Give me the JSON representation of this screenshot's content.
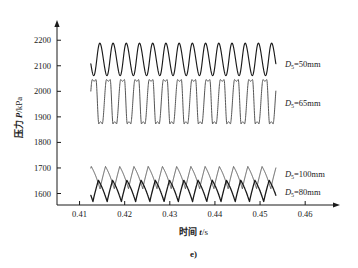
{
  "chart_data": {
    "type": "line",
    "title": "",
    "caption": "e)",
    "xlabel_cn": "时间",
    "xlabel_sym": "t",
    "xlabel_unit": "/s",
    "ylabel_cn": "压力",
    "ylabel_sym": "P",
    "ylabel_unit": "/kPa",
    "xlim": [
      0.405,
      0.4655
    ],
    "ylim": [
      1555,
      2240
    ],
    "xticks": [
      0.41,
      0.42,
      0.43,
      0.44,
      0.45,
      0.46
    ],
    "xtick_labels": [
      "0.41",
      "0.42",
      "0.43",
      "0.44",
      "0.45",
      "0.46"
    ],
    "yticks": [
      1600,
      1700,
      1800,
      1900,
      2000,
      2100,
      2200
    ],
    "ytick_labels": [
      "1600",
      "1700",
      "1800",
      "1900",
      "2000",
      "2100",
      "2200"
    ],
    "grid": false,
    "legend": "inline-right-annotations",
    "x_start": 0.4125,
    "x_end": 0.4535,
    "series": [
      {
        "name": "D5=50mm",
        "label_sym": "D",
        "label_sub": "5",
        "label_rest": "=50mm",
        "color": "#1a1a1a",
        "width": 1.15,
        "cycles": 14,
        "ymin": 2062,
        "ymax": 2188,
        "mean": 2125,
        "amplitude": 63,
        "shape": "sine",
        "skew": 0.12,
        "phase": 0.55,
        "label_x": 0.4555,
        "label_y": 2108
      },
      {
        "name": "D5=65mm",
        "label_sym": "D",
        "label_sub": "5",
        "label_rest": "=65mm",
        "color": "#555555",
        "width": 1.0,
        "cycles": 13,
        "ymin": 1872,
        "ymax": 2046,
        "mean": 1959,
        "amplitude": 87,
        "shape": "sawtooth-flattop",
        "skew": 0.34,
        "phase": 0.2,
        "label_x": 0.4555,
        "label_y": 1955
      },
      {
        "name": "D5=100mm",
        "label_sym": "D",
        "label_sub": "5",
        "label_rest": "=100mm",
        "color": "#555555",
        "width": 1.0,
        "cycles": 13,
        "ymin": 1618,
        "ymax": 1707,
        "mean": 1662,
        "amplitude": 44,
        "shape": "triangle-peaked",
        "skew": 0.2,
        "phase": 0.35,
        "label_x": 0.4555,
        "label_y": 1678
      },
      {
        "name": "D5=80mm",
        "label_sym": "D",
        "label_sub": "5",
        "label_rest": "=80mm",
        "color": "#1a1a1a",
        "width": 1.3,
        "cycles": 13,
        "ymin": 1568,
        "ymax": 1652,
        "mean": 1610,
        "amplitude": 42,
        "shape": "triangle-peaked",
        "skew": 0.25,
        "phase": 0.85,
        "label_x": 0.4555,
        "label_y": 1606
      }
    ]
  }
}
